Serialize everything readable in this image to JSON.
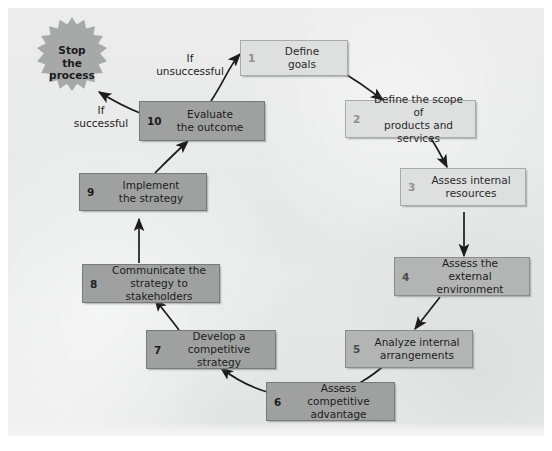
{
  "figure": {
    "background_color": "#e9eaea",
    "light_box_color": "#dedfdf",
    "mid_box_color": "#b3b5b5",
    "dark_box_color": "#9fa1a1",
    "arrow_color": "#1c1c1c"
  },
  "terminator": {
    "shape": "starburst",
    "label": "Stop\nthe\nprocess"
  },
  "nodes": [
    {
      "num": "1",
      "label": "Define\ngoals",
      "shade": "light"
    },
    {
      "num": "2",
      "label": "Define the scope of\nproducts and services",
      "shade": "light"
    },
    {
      "num": "3",
      "label": "Assess internal\nresources",
      "shade": "light"
    },
    {
      "num": "4",
      "label": "Assess the\nexternal environment",
      "shade": "mid"
    },
    {
      "num": "5",
      "label": "Analyze internal\narrangements",
      "shade": "mid"
    },
    {
      "num": "6",
      "label": "Assess competitive\nadvantage",
      "shade": "dark"
    },
    {
      "num": "7",
      "label": "Develop a\ncompetitive strategy",
      "shade": "dark"
    },
    {
      "num": "8",
      "label": "Communicate the\nstrategy to stakeholders",
      "shade": "dark"
    },
    {
      "num": "9",
      "label": "Implement\nthe strategy",
      "shade": "dark"
    },
    {
      "num": "10",
      "label": "Evaluate\nthe outcome",
      "shade": "dark"
    }
  ],
  "edge_labels": [
    {
      "id": "unsuccessful",
      "text": "If\nunsuccessful"
    },
    {
      "id": "successful",
      "text": "If\nsuccessful"
    }
  ]
}
